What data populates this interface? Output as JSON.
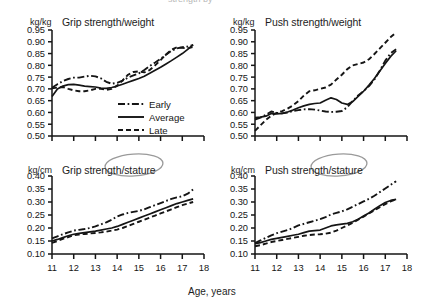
{
  "figure": {
    "background": "#ffffff",
    "ink": "#151515",
    "annotation_color": "#9a9a9a",
    "x_axis_caption": "Age, years",
    "cropped_header_text": "strength by"
  },
  "legend": {
    "position": "inside top-left panel, lower-right",
    "entries": [
      {
        "label": "Early",
        "style": "dash-dot"
      },
      {
        "label": "Average",
        "style": "solid"
      },
      {
        "label": "Late",
        "style": "dashed"
      }
    ]
  },
  "annotations": [
    {
      "name": "ellipse-around-stature-grip",
      "target": "stature",
      "panel": "grip-stature"
    },
    {
      "name": "ellipse-around-stature-push",
      "target": "stature",
      "panel": "push-stature"
    }
  ],
  "chart_data": [
    {
      "id": "grip-weight",
      "type": "line",
      "title": "Grip strength/weight",
      "ylabel": "kg/kg",
      "xlabel": "Age, years",
      "ylim": [
        0.5,
        0.95
      ],
      "xlim": [
        11,
        18
      ],
      "yticks": [
        "0.95",
        "0.90",
        "0.85",
        "0.80",
        "0.75",
        "0.70",
        "0.65",
        "0.60",
        "0.55",
        "0.50"
      ],
      "xticks": [
        "11",
        "12",
        "13",
        "14",
        "15",
        "16",
        "17",
        "18"
      ],
      "grid": false,
      "legend_position": "lower-right-inside",
      "x": [
        11.0,
        11.25,
        11.5,
        11.75,
        12.0,
        12.25,
        12.5,
        12.75,
        13.0,
        13.25,
        13.5,
        13.75,
        14.0,
        14.25,
        14.5,
        14.75,
        15.0,
        15.25,
        15.5,
        15.75,
        16.0,
        16.25,
        16.5,
        16.75,
        17.0,
        17.25,
        17.5
      ],
      "series": [
        {
          "name": "Early",
          "style": "dash-dot",
          "values": [
            0.705,
            0.72,
            0.733,
            0.742,
            0.748,
            0.748,
            0.752,
            0.756,
            0.753,
            0.745,
            0.73,
            0.722,
            0.726,
            0.735,
            0.748,
            0.757,
            0.766,
            0.78,
            0.797,
            0.812,
            0.828,
            0.845,
            0.862,
            0.872,
            0.877,
            0.88,
            0.886
          ]
        },
        {
          "name": "Average",
          "style": "solid",
          "values": [
            0.668,
            0.7,
            0.712,
            0.718,
            0.719,
            0.716,
            0.712,
            0.71,
            0.708,
            0.703,
            0.702,
            0.706,
            0.712,
            0.72,
            0.728,
            0.736,
            0.744,
            0.754,
            0.766,
            0.779,
            0.792,
            0.806,
            0.82,
            0.835,
            0.85,
            0.868,
            0.888
          ]
        },
        {
          "name": "Late",
          "style": "dashed",
          "values": [
            0.702,
            0.706,
            0.708,
            0.7,
            0.694,
            0.69,
            0.69,
            0.694,
            0.7,
            0.7,
            0.696,
            0.7,
            0.714,
            0.736,
            0.76,
            0.772,
            0.774,
            0.77,
            0.78,
            0.8,
            0.822,
            0.846,
            0.866,
            0.876,
            0.874,
            0.872,
            0.878
          ]
        }
      ]
    },
    {
      "id": "push-weight",
      "type": "line",
      "title": "Push strength/weight",
      "ylabel": "kg/kg",
      "xlabel": "Age, years",
      "ylim": [
        0.5,
        0.95
      ],
      "xlim": [
        11,
        18
      ],
      "yticks": [
        "0.95",
        "0.90",
        "0.85",
        "0.80",
        "0.75",
        "0.70",
        "0.65",
        "0.60",
        "0.55",
        "0.50"
      ],
      "xticks": [
        "11",
        "12",
        "13",
        "14",
        "15",
        "16",
        "17",
        "18"
      ],
      "grid": false,
      "legend_position": "none",
      "x": [
        11.0,
        11.25,
        11.5,
        11.75,
        12.0,
        12.25,
        12.5,
        12.75,
        13.0,
        13.25,
        13.5,
        13.75,
        14.0,
        14.25,
        14.5,
        14.75,
        15.0,
        15.25,
        15.5,
        15.75,
        16.0,
        16.25,
        16.5,
        16.75,
        17.0,
        17.25,
        17.5
      ],
      "series": [
        {
          "name": "Early",
          "style": "dash-dot",
          "values": [
            0.57,
            0.578,
            0.59,
            0.604,
            0.598,
            0.596,
            0.6,
            0.606,
            0.61,
            0.613,
            0.614,
            0.612,
            0.608,
            0.604,
            0.602,
            0.603,
            0.606,
            0.622,
            0.648,
            0.672,
            0.69,
            0.712,
            0.74,
            0.778,
            0.82,
            0.852,
            0.868
          ]
        },
        {
          "name": "Average",
          "style": "solid",
          "values": [
            0.578,
            0.58,
            0.584,
            0.596,
            0.594,
            0.596,
            0.602,
            0.61,
            0.62,
            0.628,
            0.634,
            0.638,
            0.64,
            0.652,
            0.662,
            0.655,
            0.64,
            0.634,
            0.646,
            0.668,
            0.69,
            0.716,
            0.744,
            0.776,
            0.808,
            0.838,
            0.862
          ]
        },
        {
          "name": "Late",
          "style": "dashed",
          "values": [
            0.522,
            0.545,
            0.568,
            0.586,
            0.598,
            0.606,
            0.616,
            0.63,
            0.648,
            0.672,
            0.69,
            0.694,
            0.7,
            0.706,
            0.718,
            0.74,
            0.76,
            0.784,
            0.8,
            0.806,
            0.812,
            0.826,
            0.848,
            0.872,
            0.896,
            0.92,
            0.94
          ]
        }
      ]
    },
    {
      "id": "grip-stature",
      "type": "line",
      "title": "Grip strength/stature",
      "ylabel": "kg/cm",
      "xlabel": "Age, years",
      "ylim": [
        0.1,
        0.4
      ],
      "xlim": [
        11,
        18
      ],
      "yticks": [
        "0.40",
        "0.35",
        "0.30",
        "0.25",
        "0.20",
        "0.15",
        "0.10"
      ],
      "xticks": [
        "11",
        "12",
        "13",
        "14",
        "15",
        "16",
        "17",
        "18"
      ],
      "grid": false,
      "legend_position": "none",
      "x": [
        11.0,
        11.25,
        11.5,
        11.75,
        12.0,
        12.25,
        12.5,
        12.75,
        13.0,
        13.25,
        13.5,
        13.75,
        14.0,
        14.25,
        14.5,
        14.75,
        15.0,
        15.25,
        15.5,
        15.75,
        16.0,
        16.25,
        16.5,
        16.75,
        17.0,
        17.25,
        17.5
      ],
      "series": [
        {
          "name": "Early",
          "style": "dash-dot",
          "values": [
            0.16,
            0.168,
            0.176,
            0.183,
            0.19,
            0.193,
            0.196,
            0.2,
            0.206,
            0.214,
            0.222,
            0.232,
            0.244,
            0.252,
            0.258,
            0.262,
            0.266,
            0.272,
            0.28,
            0.288,
            0.296,
            0.304,
            0.312,
            0.318,
            0.322,
            0.332,
            0.348
          ]
        },
        {
          "name": "Average",
          "style": "solid",
          "values": [
            0.15,
            0.156,
            0.163,
            0.17,
            0.176,
            0.179,
            0.182,
            0.185,
            0.188,
            0.192,
            0.196,
            0.2,
            0.206,
            0.214,
            0.222,
            0.23,
            0.238,
            0.246,
            0.254,
            0.262,
            0.27,
            0.278,
            0.286,
            0.294,
            0.3,
            0.306,
            0.312
          ]
        },
        {
          "name": "Late",
          "style": "dashed",
          "values": [
            0.143,
            0.15,
            0.158,
            0.165,
            0.172,
            0.175,
            0.177,
            0.179,
            0.181,
            0.183,
            0.186,
            0.19,
            0.194,
            0.2,
            0.208,
            0.216,
            0.224,
            0.232,
            0.24,
            0.248,
            0.256,
            0.264,
            0.272,
            0.28,
            0.288,
            0.294,
            0.3
          ]
        }
      ]
    },
    {
      "id": "push-stature",
      "type": "line",
      "title": "Push strength/stature",
      "ylabel": "kg/cm",
      "xlabel": "Age, years",
      "ylim": [
        0.1,
        0.4
      ],
      "xlim": [
        11,
        18
      ],
      "yticks": [
        "0.40",
        "0.35",
        "0.30",
        "0.25",
        "0.20",
        "0.15",
        "0.10"
      ],
      "xticks": [
        "11",
        "12",
        "13",
        "14",
        "15",
        "16",
        "17",
        "18"
      ],
      "grid": false,
      "legend_position": "none",
      "x": [
        11.0,
        11.25,
        11.5,
        11.75,
        12.0,
        12.25,
        12.5,
        12.75,
        13.0,
        13.25,
        13.5,
        13.75,
        14.0,
        14.25,
        14.5,
        14.75,
        15.0,
        15.25,
        15.5,
        15.75,
        16.0,
        16.25,
        16.5,
        16.75,
        17.0,
        17.25,
        17.5
      ],
      "series": [
        {
          "name": "Early",
          "style": "dash-dot",
          "values": [
            0.142,
            0.152,
            0.162,
            0.172,
            0.18,
            0.186,
            0.192,
            0.2,
            0.21,
            0.216,
            0.222,
            0.228,
            0.234,
            0.242,
            0.252,
            0.258,
            0.264,
            0.272,
            0.282,
            0.292,
            0.302,
            0.312,
            0.324,
            0.338,
            0.352,
            0.366,
            0.38
          ]
        },
        {
          "name": "Average",
          "style": "solid",
          "values": [
            0.14,
            0.144,
            0.15,
            0.156,
            0.16,
            0.164,
            0.168,
            0.172,
            0.176,
            0.182,
            0.188,
            0.19,
            0.192,
            0.2,
            0.208,
            0.212,
            0.215,
            0.218,
            0.224,
            0.234,
            0.246,
            0.258,
            0.272,
            0.286,
            0.298,
            0.306,
            0.31
          ]
        },
        {
          "name": "Late",
          "style": "dashed",
          "values": [
            0.13,
            0.134,
            0.14,
            0.146,
            0.15,
            0.154,
            0.158,
            0.162,
            0.166,
            0.17,
            0.173,
            0.175,
            0.176,
            0.178,
            0.182,
            0.19,
            0.2,
            0.21,
            0.22,
            0.232,
            0.244,
            0.256,
            0.268,
            0.28,
            0.292,
            0.302,
            0.31
          ]
        }
      ]
    }
  ]
}
